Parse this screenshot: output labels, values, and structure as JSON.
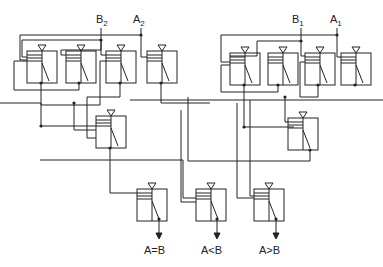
{
  "diagram": {
    "type": "relay logic comparator circuit",
    "inputs": [
      {
        "name": "B",
        "subscript": "2"
      },
      {
        "name": "A",
        "subscript": "2"
      },
      {
        "name": "B",
        "subscript": "1"
      },
      {
        "name": "A",
        "subscript": "1"
      }
    ],
    "outputs": [
      "A=B",
      "A<B",
      "A>B"
    ],
    "colors": {
      "line": "#222222",
      "background": "#ffffff"
    }
  }
}
